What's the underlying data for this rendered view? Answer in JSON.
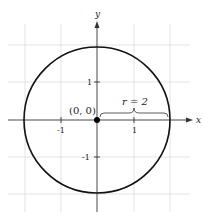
{
  "diagram": {
    "axes": {
      "x_label": "x",
      "y_label": "y",
      "x_ticks": [
        "-1",
        "1"
      ],
      "y_ticks": [
        "1",
        "-1"
      ]
    },
    "center_label": "(0, 0)",
    "radius_label": "r = 2",
    "colors": {
      "grid": "#d9d9d9",
      "axis": "#333333",
      "circle": "#111111"
    }
  }
}
